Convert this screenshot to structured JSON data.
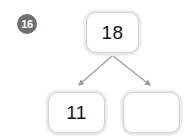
{
  "worksheet": {
    "question_number": "16",
    "type": "number-bond",
    "colors": {
      "background": "#ffffff",
      "badge_fill": "#6f6f6f",
      "badge_text": "#ffffff",
      "box_border": "#d2d2d2",
      "box_fill": "#ffffff",
      "number_text": "#151515",
      "arrow": "#9b9b9b"
    },
    "whole": {
      "label": "18",
      "name": "whole-box"
    },
    "parts": [
      {
        "label": "11",
        "name": "part-box-left",
        "filled": true
      },
      {
        "label": "",
        "name": "part-box-right",
        "filled": false
      }
    ],
    "arrows": [
      {
        "name": "arrow-to-left-part",
        "direction": "down-left"
      },
      {
        "name": "arrow-to-right-part",
        "direction": "down-right"
      }
    ]
  }
}
